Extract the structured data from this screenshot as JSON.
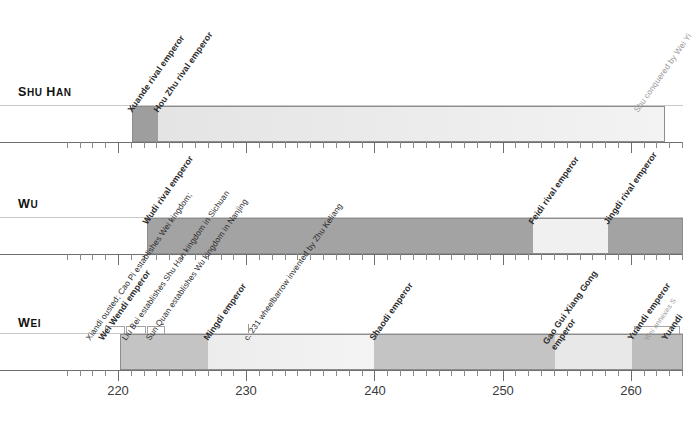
{
  "chart_data": {
    "type": "bar",
    "xlabel": "",
    "ylabel": "",
    "xlim": [
      216,
      265
    ],
    "x_ticks_major": [
      220,
      230,
      240,
      250,
      260
    ],
    "x_tick_labels": [
      "220",
      "230",
      "240",
      "250",
      "260"
    ],
    "minor_tick_interval": 1,
    "grid": false,
    "legend": "none",
    "orientation": "horizontal",
    "categories": [
      "Shu Han",
      "Wu",
      "Wei"
    ],
    "series": [
      {
        "name": "Shu Han",
        "segments": [
          {
            "label": "Xuande rival emperor",
            "start": 221,
            "end": 223,
            "color": "#9e9e9e"
          },
          {
            "label": "Hou Zhu rival emperor",
            "start": 223,
            "end": 263,
            "color": "#dcdcdc"
          }
        ]
      },
      {
        "name": "Wu",
        "segments": [
          {
            "label": "Wudi rival emperor",
            "start": 222,
            "end": 252,
            "color": "#a3a3a3"
          },
          {
            "label": "Feidi rival emperor",
            "start": 252,
            "end": 258,
            "color": "#f0f0f0"
          },
          {
            "label": "Jingdi rival emperor",
            "start": 258,
            "end": 265,
            "color": "#a3a3a3"
          }
        ]
      },
      {
        "name": "Wei",
        "segments": [
          {
            "label": "Wei Wendi emperor",
            "start": 220,
            "end": 227,
            "color": "#c4c4c4"
          },
          {
            "label": "Mingdi emperor",
            "start": 227,
            "end": 240,
            "color": "#eeeeee"
          },
          {
            "label": "Shaodi emperor",
            "start": 240,
            "end": 254,
            "color": "#c4c4c4"
          },
          {
            "label": "Gao Gui Xiang Gong emperor",
            "start": 254,
            "end": 260,
            "color": "#e8e8e8"
          },
          {
            "label": "Yuandi emperor",
            "start": 260,
            "end": 265,
            "color": "#bdbdbd"
          }
        ]
      }
    ]
  },
  "rows": {
    "shu_han": {
      "label_main": "S",
      "label_rest": "HU ",
      "label_h": "H",
      "label_an": "AN",
      "full_label": "Shu Han"
    },
    "wu": {
      "full_label": "Wu"
    },
    "wei": {
      "full_label": "Wei"
    }
  },
  "labels": {
    "shu_han": "Shu Han",
    "wu": "Wu",
    "wei": "Wei"
  },
  "events": {
    "shu_han": [
      {
        "text": "Xuande rival emperor",
        "year": 221,
        "style": "bold"
      },
      {
        "text": "Hou Zhu rival emperor",
        "year": 223,
        "style": "bold"
      },
      {
        "text": "Shu conquered by Wei Yi",
        "year": 263,
        "style": "faint"
      }
    ],
    "wu": [
      {
        "text": "Wudi rival emperor",
        "year": 222,
        "style": "bold"
      },
      {
        "text": "Feidi rival emperor",
        "year": 252,
        "style": "bold"
      },
      {
        "text": "Jingdi rival emperor",
        "year": 258,
        "style": "bold"
      }
    ],
    "wei": [
      {
        "text": "Xiandi ousted; Cao Pi establishes Wei kingdom;",
        "year": 220,
        "style": "normal"
      },
      {
        "text": "Wei Wendi emperor",
        "year": 220,
        "style": "bold"
      },
      {
        "text": "Liu Bei establishes Shu Han kingdom in Sichuan",
        "year": 221,
        "style": "normal"
      },
      {
        "text": "Sun Quan establishes Wu kingdom in Nanjing",
        "year": 222,
        "style": "normal"
      },
      {
        "text": "Mingdi emperor",
        "year": 227,
        "style": "bold"
      },
      {
        "text": "c. 231 wheelbarrow invented by Zhu Keliang",
        "year": 231,
        "style": "normal"
      },
      {
        "text": "Shaodi emperor",
        "year": 240,
        "style": "bold"
      },
      {
        "text": "Gao Gui Xiang Gong emperor",
        "year": 254,
        "style": "bold"
      },
      {
        "text": "Yuandi emperor",
        "year": 260,
        "style": "bold"
      },
      {
        "text": "Wei annexes S",
        "year": 261,
        "style": "faint"
      },
      {
        "text": "Yuandi",
        "year": 263,
        "style": "bold"
      }
    ]
  },
  "year_ticks": [
    {
      "value": "220",
      "year": 220
    },
    {
      "value": "230",
      "year": 230
    },
    {
      "value": "240",
      "year": 240
    },
    {
      "value": "250",
      "year": 250
    },
    {
      "value": "260",
      "year": 260
    }
  ],
  "colors": {
    "dark_grey": "#9e9e9e",
    "light_grey": "#dcdcdc",
    "mid_grey": "#a3a3a3",
    "pale": "#f0f0f0",
    "axis": "#6e6e6e",
    "text": "#2b2b2b"
  }
}
